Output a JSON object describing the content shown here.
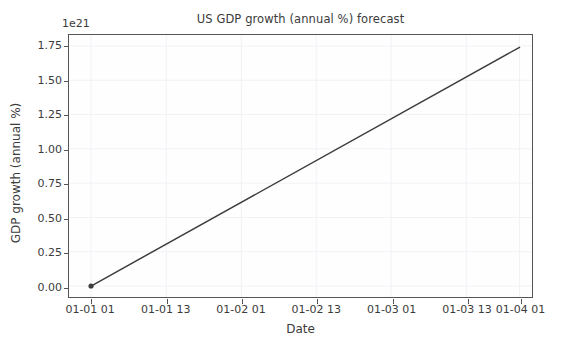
{
  "chart_data": {
    "type": "line",
    "title": "US GDP growth (annual %) forecast",
    "xlabel": "Date",
    "ylabel": "GDP growth (annual %)",
    "y_offset_label": "1e21",
    "y_offset_multiplier": 1e+21,
    "grid": true,
    "legend": "none",
    "line_color": "#3d3d3d",
    "marker_color": "#3d3d3d",
    "background_color": "#ffffff",
    "axes_color": "#555555",
    "grid_color": "#f2f2f5",
    "xlim": [
      "01-01 00",
      "01-04 03"
    ],
    "ylim": [
      -0.08,
      1.83
    ],
    "ytick_labels": [
      "0.00",
      "0.25",
      "0.50",
      "0.75",
      "1.00",
      "1.25",
      "1.50",
      "1.75"
    ],
    "ytick_values": [
      0.0,
      0.25,
      0.5,
      0.75,
      1.0,
      1.25,
      1.5,
      1.75
    ],
    "xtick_labels": [
      "01-01 01",
      "01-01 13",
      "01-02 01",
      "01-02 13",
      "01-03 01",
      "01-03 13",
      "01-04 01"
    ],
    "xtick_positions": [
      0.0476,
      0.2103,
      0.3722,
      0.5341,
      0.696,
      0.8579,
      0.973
    ],
    "series": [
      {
        "name": "US GDP growth (annual %) forecast",
        "x": [
          "01-01 01",
          "01-04 01"
        ],
        "x_positions": [
          0.0476,
          0.973
        ],
        "values": [
          0.0,
          1.74
        ],
        "values_scaled": [
          0.0,
          1.74e+21
        ],
        "markers": [
          {
            "x_position": 0.0476,
            "value": 0.0
          }
        ]
      }
    ]
  },
  "figure": {
    "width": 565,
    "height": 353
  }
}
